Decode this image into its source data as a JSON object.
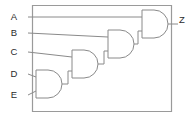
{
  "diagram": {
    "type": "logic-circuit",
    "gate_type": "AND",
    "gate_count": 4,
    "output_expression": "Z = A AND (B AND (C AND (D AND E)))",
    "colors": {
      "background": "#ffffff",
      "wire": "#8a8a8a",
      "gate_outline": "#8a8a8a",
      "frame": "#9a9a9a",
      "label_text": "#2b2b2b"
    },
    "inputs": [
      {
        "id": "in-a",
        "label": "A",
        "x": 18,
        "y": 17
      },
      {
        "id": "in-b",
        "label": "B",
        "x": 18,
        "y": 33
      },
      {
        "id": "in-c",
        "label": "C",
        "x": 18,
        "y": 52
      },
      {
        "id": "in-d",
        "label": "D",
        "x": 18,
        "y": 74
      },
      {
        "id": "in-e",
        "label": "E",
        "x": 18,
        "y": 95
      }
    ],
    "outputs": [
      {
        "id": "out-z",
        "label": "Z",
        "x": 180,
        "y": 22
      }
    ],
    "gates": [
      {
        "id": "gate-1",
        "label": "AND",
        "inputs": [
          "D",
          "E"
        ],
        "output": "DE",
        "x": 36,
        "y": 70,
        "w": 24,
        "h": 28
      },
      {
        "id": "gate-2",
        "label": "AND",
        "inputs": [
          "C",
          "DE"
        ],
        "output": "CDE",
        "x": 72,
        "y": 50,
        "w": 24,
        "h": 28
      },
      {
        "id": "gate-3",
        "label": "AND",
        "inputs": [
          "B",
          "CDE"
        ],
        "output": "BCDE",
        "x": 108,
        "y": 30,
        "w": 24,
        "h": 28
      },
      {
        "id": "gate-4",
        "label": "AND",
        "inputs": [
          "A",
          "BCDE"
        ],
        "output": "Z",
        "x": 142,
        "y": 10,
        "w": 24,
        "h": 28
      }
    ],
    "frame": {
      "x": 32,
      "y": 5,
      "w": 140,
      "h": 107
    }
  }
}
